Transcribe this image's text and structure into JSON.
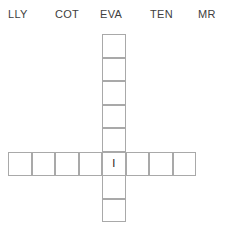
{
  "header": {
    "labels": [
      {
        "text": "LLY",
        "x": 8
      },
      {
        "text": "COT",
        "x": 55
      },
      {
        "text": "EVA",
        "x": 100
      },
      {
        "text": "TEN",
        "x": 150
      },
      {
        "text": "MR",
        "x": 198
      }
    ]
  },
  "grid": {
    "cell_size": 23.5,
    "border_color": "#a9a9a9",
    "across": {
      "left": 8,
      "top": 152,
      "count": 8,
      "cells": [
        "",
        "",
        "",
        "",
        "I",
        "",
        "",
        ""
      ]
    },
    "down": {
      "left": 102,
      "top": 34,
      "count": 8,
      "intersect_index": 5,
      "cells": [
        "",
        "",
        "",
        "",
        "",
        "I",
        "",
        ""
      ]
    },
    "intersection_letter": "I"
  }
}
